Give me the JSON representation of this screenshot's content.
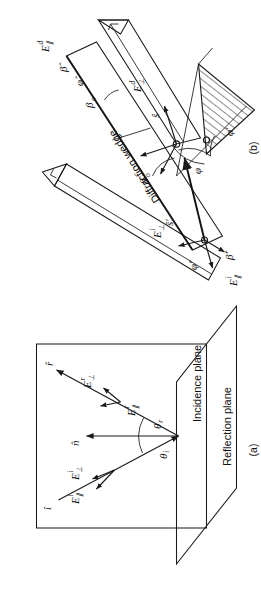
{
  "figure": {
    "orientation": "rotated-90-ccw",
    "background_color": "#ffffff",
    "ink_color": "#1a1a1a"
  },
  "panels": [
    {
      "id": "a",
      "caption": "(a)",
      "plane_labels": {
        "incidence": "Incidence plane",
        "reflection": "Reflection plane"
      },
      "angles": [
        {
          "name": "theta-i",
          "label": "θ",
          "sub": "i"
        },
        {
          "name": "theta-r",
          "label": "θ",
          "sub": "r"
        }
      ],
      "vectors": [
        {
          "name": "incident-unit-vector",
          "label": "î",
          "glyph": "i"
        },
        {
          "name": "reflected-unit-vector",
          "label": "r̂",
          "glyph": "r"
        },
        {
          "name": "normal-unit-vector",
          "label": "n̂",
          "glyph": "n"
        }
      ],
      "fields": [
        {
          "name": "E-parallel-incident",
          "base": "E",
          "sub": "∥",
          "sup": "i"
        },
        {
          "name": "E-perp-incident",
          "base": "E",
          "sub": "⊥",
          "sup": "i"
        },
        {
          "name": "E-parallel-reflected",
          "base": "E",
          "sub": "∥",
          "sup": "r"
        },
        {
          "name": "E-perp-reflected",
          "base": "E",
          "sub": "⊥",
          "sup": "r"
        }
      ]
    },
    {
      "id": "b",
      "caption": "(b)",
      "wedge_label": "Diffraction wedge",
      "angles": [
        {
          "name": "phi-diffraction",
          "label": "φ",
          "sub": ""
        },
        {
          "name": "phi-incidence",
          "label": "φ",
          "sub": "′"
        },
        {
          "name": "beta-o-incident",
          "label": "β",
          "sub": "o",
          "sup": "′"
        },
        {
          "name": "beta-o-diffracted",
          "label": "β",
          "sub": "o",
          "sup": ""
        }
      ],
      "vectors": [
        {
          "name": "s-prime-unit-vector",
          "label": "ŝ′",
          "glyph": "s'"
        },
        {
          "name": "s-unit-vector",
          "label": "ŝ",
          "glyph": "s"
        },
        {
          "name": "beta-o-hat-incident",
          "label": "β̂′",
          "glyph": "b'"
        },
        {
          "name": "beta-o-hat-diffracted",
          "label": "β̂",
          "glyph": "b"
        },
        {
          "name": "phi-hat-incident",
          "label": "φ̂′",
          "glyph": "p'"
        },
        {
          "name": "phi-hat-diffracted",
          "label": "φ̂",
          "glyph": "p"
        }
      ],
      "fields": [
        {
          "name": "E-parallel-incident",
          "base": "E",
          "sub": "∥",
          "sup": "i"
        },
        {
          "name": "E-perp-incident",
          "base": "E",
          "sub": "⊥",
          "sup": "i"
        },
        {
          "name": "E-parallel-diffracted",
          "base": "E",
          "sub": "∥",
          "sup": "d"
        },
        {
          "name": "E-perp-diffracted",
          "base": "E",
          "sub": "⊥",
          "sup": "d"
        }
      ]
    }
  ],
  "panel_a_text": {
    "caption": "(a)",
    "incidence_plane": "Incidence plane",
    "reflection_plane": "Reflection plane",
    "E_par_i_base": "E",
    "E_par_i_sub": "∥",
    "E_par_i_sup": "i",
    "E_perp_i_base": "E",
    "E_perp_i_sub": "⊥",
    "E_perp_i_sup": "i",
    "E_par_r_base": "E",
    "E_par_r_sub": "∥",
    "E_par_r_sup": "r",
    "E_perp_r_base": "E",
    "E_perp_r_sub": "⊥",
    "E_perp_r_sup": "r",
    "theta_i_base": "θ",
    "theta_i_sub": "i",
    "theta_r_base": "θ",
    "theta_r_sub": "r",
    "i_hat": "î",
    "r_hat": "r̂",
    "n_hat": "n̂"
  },
  "panel_b_text": {
    "caption": "(b)",
    "wedge": "Diffraction wedge",
    "E_par_i_base": "E",
    "E_par_i_sub": "∥",
    "E_par_i_sup": "i",
    "E_perp_i_base": "E",
    "E_perp_i_sub": "⊥",
    "E_perp_i_sup": "i",
    "E_par_d_base": "E",
    "E_par_d_sub": "∥",
    "E_par_d_sup": "d",
    "E_perp_d_base": "E",
    "E_perp_d_sub": "⊥",
    "E_perp_d_sup": "d",
    "beta_o_prime_base": "β",
    "beta_o_prime_sub": "o",
    "beta_o_prime_sup": "′",
    "beta_o_base": "β",
    "beta_o_sub": "o",
    "phi": "φ",
    "phi_prime": "φ′",
    "s_prime_hat": "ŝ′",
    "s_hat": "ŝ",
    "beta_hat_prime": "β̂′",
    "beta_hat": "β̂",
    "phi_hat_prime": "φ̂′",
    "phi_hat": "φ̂"
  }
}
